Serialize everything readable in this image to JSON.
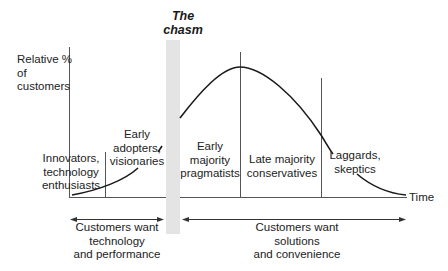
{
  "diagram": {
    "title": "The chasm",
    "title_lines": [
      "The",
      "chasm"
    ],
    "y_axis_label_lines": [
      "Relative %",
      "of",
      "customers"
    ],
    "x_axis_label": "Time",
    "segments": [
      {
        "name": "innovators",
        "lines": [
          "Innovators,",
          "technology",
          "enthusiasts"
        ]
      },
      {
        "name": "early-adopters",
        "lines": [
          "Early",
          "adopters,",
          "visionaries"
        ]
      },
      {
        "name": "early-majority",
        "lines": [
          "Early",
          "majority",
          "pragmatists"
        ]
      },
      {
        "name": "late-majority",
        "lines": [
          "Late majority",
          "conservatives"
        ]
      },
      {
        "name": "laggards",
        "lines": [
          "Laggards,",
          "skeptics"
        ]
      }
    ],
    "bottom_ranges": [
      {
        "name": "technology-and-performance",
        "lines": [
          "Customers want",
          "technology",
          "and performance"
        ]
      },
      {
        "name": "solutions-and-convenience",
        "lines": [
          "Customers want",
          "solutions",
          "and convenience"
        ]
      }
    ],
    "colors": {
      "line": "#1a1a1a",
      "axis": "#555555",
      "chasm_band": "#e4e4e4",
      "background": "#ffffff"
    }
  }
}
